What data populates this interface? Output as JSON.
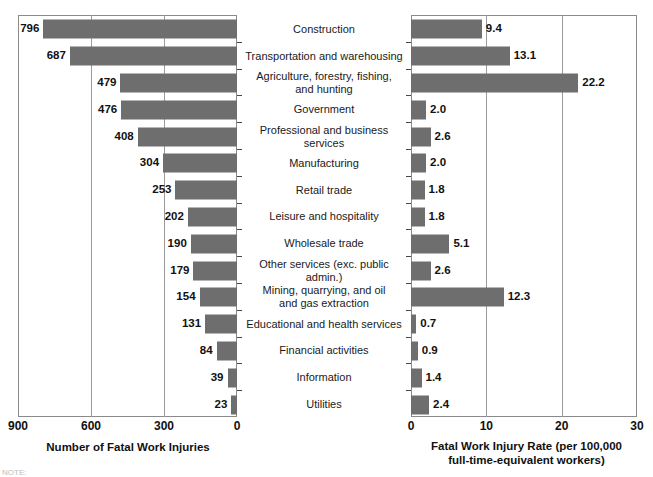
{
  "chart_data": [
    {
      "type": "bar",
      "id": "fatal-work-injuries-count",
      "orientation": "horizontal",
      "direction": "right-to-left",
      "title": "",
      "xlabel": "Number of Fatal Work Injuries",
      "ylabel": "",
      "xlim": [
        0,
        900
      ],
      "xticks": [
        900,
        600,
        300,
        0
      ],
      "xtick_labels": [
        "900",
        "600",
        "300",
        "0"
      ],
      "grid": true,
      "legend": false,
      "categories": [
        "Construction",
        "Transportation and warehousing",
        "Agriculture, forestry, fishing, and hunting",
        "Government",
        "Professional and business services",
        "Manufacturing",
        "Retail trade",
        "Leisure and hospitality",
        "Wholesale trade",
        "Other services (exc. public admin.)",
        "Mining, quarrying, and oil and gas extraction",
        "Educational and health services",
        "Financial activities",
        "Information",
        "Utilities"
      ],
      "values": [
        796,
        687,
        479,
        476,
        408,
        304,
        253,
        202,
        190,
        179,
        154,
        131,
        84,
        39,
        23
      ],
      "value_labels": [
        "796",
        "687",
        "479",
        "476",
        "408",
        "304",
        "253",
        "202",
        "190",
        "179",
        "154",
        "131",
        "84",
        "39",
        "23"
      ]
    },
    {
      "type": "bar",
      "id": "fatal-work-injury-rate",
      "orientation": "horizontal",
      "direction": "left-to-right",
      "title": "",
      "xlabel": "Fatal Work Injury Rate (per 100,000\nfull-time-equivalent workers)",
      "ylabel": "",
      "xlim": [
        0,
        30
      ],
      "xticks": [
        0,
        10,
        20,
        30
      ],
      "xtick_labels": [
        "0",
        "10",
        "20",
        "30"
      ],
      "grid": true,
      "legend": false,
      "categories": [
        "Construction",
        "Transportation and warehousing",
        "Agriculture, forestry, fishing, and hunting",
        "Government",
        "Professional and business services",
        "Manufacturing",
        "Retail trade",
        "Leisure and hospitality",
        "Wholesale trade",
        "Other services (exc. public admin.)",
        "Mining, quarrying, and oil and gas extraction",
        "Educational and health services",
        "Financial activities",
        "Information",
        "Utilities"
      ],
      "values": [
        9.4,
        13.1,
        22.2,
        2.0,
        2.6,
        2.0,
        1.8,
        1.8,
        5.1,
        2.6,
        12.3,
        0.7,
        0.9,
        1.4,
        2.4
      ],
      "value_labels": [
        "9.4",
        "13.1",
        "22.2",
        "2.0",
        "2.6",
        "2.0",
        "1.8",
        "1.8",
        "5.1",
        "2.6",
        "12.3",
        "0.7",
        "0.9",
        "1.4",
        "2.4"
      ]
    }
  ],
  "category_labels": [
    "Construction",
    "Transportation and warehousing",
    "Agriculture, forestry, fishing,\nand hunting",
    "Government",
    "Professional and business services",
    "Manufacturing",
    "Retail trade",
    "Leisure and hospitality",
    "Wholesale trade",
    "Other services (exc. public admin.)",
    "Mining, quarrying, and oil\nand gas extraction",
    "Educational and health services",
    "Financial activities",
    "Information",
    "Utilities"
  ],
  "left_axis_title": "Number of Fatal Work Injuries",
  "right_axis_title_line1": "Fatal Work Injury Rate (per 100,000",
  "right_axis_title_line2": "full-time-equivalent workers)",
  "footnote": "NOTE:",
  "colors": {
    "bar_fill": "#6e6e6e",
    "frame": "#8a8a8a",
    "gridline": "#9a9a9a",
    "text": "#1a1a1a",
    "background": "#ffffff"
  }
}
